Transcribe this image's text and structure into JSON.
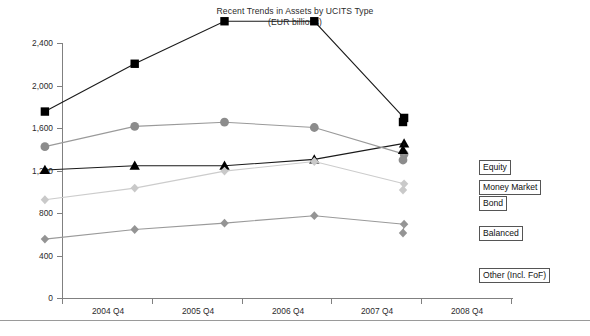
{
  "chart_data": {
    "type": "line",
    "title": "Recent Trends in Assets by UCITS Type",
    "subtitle": "(EUR billions)",
    "xlabel": "",
    "ylabel": "",
    "categories": [
      "2004 Q4",
      "2005 Q4",
      "2006 Q4",
      "2007 Q4",
      "2008 Q4"
    ],
    "ylim": [
      0,
      2400
    ],
    "yticks": [
      0,
      400,
      800,
      1200,
      1600,
      2000,
      2400
    ],
    "ytick_labels": [
      "0",
      "400",
      "800",
      "1,200",
      "1,600",
      "2,000",
      "2,400"
    ],
    "grid": false,
    "legend_position": "right-inline-labels",
    "series": [
      {
        "name": "Equity",
        "marker": "square",
        "color": "#000000",
        "line_color": "#1a1a1a",
        "values": [
          1350,
          1800,
          2200,
          2200,
          1290
        ]
      },
      {
        "name": "Money Market",
        "marker": "triangle",
        "color": "#000000",
        "line_color": "#1a1a1a",
        "values": [
          800,
          840,
          840,
          900,
          1050
        ]
      },
      {
        "name": "Bond",
        "marker": "circle",
        "color": "#8c8c8c",
        "line_color": "#9a9a9a",
        "values": [
          1020,
          1210,
          1250,
          1200,
          950
        ]
      },
      {
        "name": "Balanced",
        "marker": "diamond",
        "color": "#c9c9c9",
        "line_color": "#cccccc",
        "values": [
          520,
          630,
          790,
          880,
          670
        ]
      },
      {
        "name": "Other (Incl. FoF)",
        "marker": "diamond",
        "color": "#949494",
        "line_color": "#9a9a9a",
        "values": [
          150,
          240,
          300,
          370,
          290
        ]
      }
    ]
  },
  "legend": {
    "items": [
      {
        "label": "Equity"
      },
      {
        "label": "Money Market"
      },
      {
        "label": "Bond"
      },
      {
        "label": "Balanced"
      },
      {
        "label": "Other (Incl. FoF)"
      }
    ]
  },
  "colors": {
    "axis": "#808080",
    "text": "#2b2b2b",
    "background": "#ffffff",
    "rule": "#9a9a9a"
  }
}
